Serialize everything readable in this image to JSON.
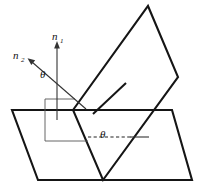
{
  "figure": {
    "background_color": "#ffffff",
    "stroke_color": "#151515",
    "thin_stroke_color": "#555555",
    "width": 204,
    "height": 191
  },
  "labels": {
    "normal_1": {
      "symbol": "n",
      "subscript": "1",
      "x": 56,
      "y": 38
    },
    "normal_2": {
      "symbol": "n",
      "subscript": "2",
      "x": 17,
      "y": 58
    },
    "theta_upper": {
      "symbol": "θ",
      "x": 42,
      "y": 76
    },
    "theta_lower": {
      "symbol": "θ",
      "x": 103,
      "y": 136
    }
  },
  "shapes": {
    "horizontal_plane": {
      "name": "horizontal-plane",
      "points": "12,110 172,110 192,180 38,180"
    },
    "tilted_plane": {
      "name": "tilted-plane",
      "points": "73,110 148,6 178,77 103,180"
    },
    "normal_1_axis": {
      "name": "normal-1-axis",
      "from_x": 57,
      "from_y": 118,
      "to_x": 57,
      "to_y": 44
    },
    "normal_2_axis": {
      "name": "normal-2-axis",
      "from_x": 85,
      "from_y": 108,
      "to_x": 29,
      "to_y": 60
    },
    "incident_ray": {
      "name": "incident-ray",
      "from_x": 94,
      "from_y": 113,
      "to_x": 126,
      "to_y": 83
    },
    "dashed_baseline": {
      "name": "dashed-baseline",
      "from_x": 88,
      "from_y": 137,
      "to_x": 130,
      "to_y": 137
    },
    "solid_baseline": {
      "name": "solid-baseline",
      "from_x": 130,
      "from_y": 137,
      "to_x": 149,
      "to_y": 137
    },
    "guide_vertical": {
      "name": "guide-vertical-left",
      "from_x": 45,
      "from_y": 99,
      "to_x": 45,
      "to_y": 141
    },
    "guide_horizontal": {
      "name": "guide-horizontal-bottom",
      "from_x": 45,
      "from_y": 141,
      "to_x": 88,
      "to_y": 141
    },
    "guide_top": {
      "name": "guide-horizontal-top",
      "from_x": 45,
      "from_y": 99,
      "to_x": 75,
      "to_y": 99
    }
  },
  "angles": {
    "theta_upper_value": "θ",
    "theta_lower_value": "θ"
  }
}
